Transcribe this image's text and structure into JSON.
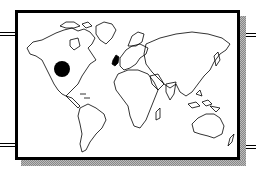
{
  "illustration": {
    "subject": "World map clip-art in a framed panel",
    "marker": {
      "shape": "filled-circle",
      "color": "#000000",
      "location": "central North America"
    },
    "highlighted_region": {
      "name": "United Kingdom and Ireland",
      "fill": "#000000"
    },
    "colors": {
      "frame": "#000000",
      "background": "#ffffff",
      "shadow": "#999999"
    }
  }
}
